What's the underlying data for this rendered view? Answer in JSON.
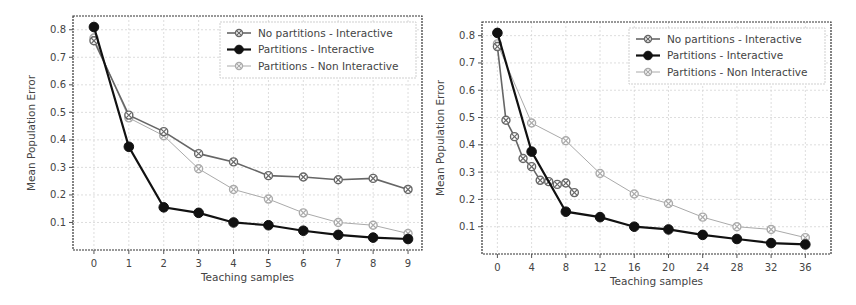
{
  "chart_data": [
    {
      "type": "line",
      "title": "",
      "xlabel": "Teaching samples",
      "ylabel": "Mean Population Error",
      "x": [
        0,
        1,
        2,
        3,
        4,
        5,
        6,
        7,
        8,
        9
      ],
      "xticks": [
        0,
        1,
        2,
        3,
        4,
        5,
        6,
        7,
        8,
        9
      ],
      "yticks": [
        0.1,
        0.2,
        0.3,
        0.4,
        0.5,
        0.6,
        0.7,
        0.8
      ],
      "xlim": [
        -0.6,
        9.4
      ],
      "ylim": [
        0.0,
        0.85
      ],
      "grid": true,
      "legend_position": "upper right",
      "series": [
        {
          "name": "No partitions - Interactive",
          "color": "#666666",
          "marker": "diamond-hatched",
          "x": [
            0,
            1,
            2,
            3,
            4,
            5,
            6,
            7,
            8,
            9
          ],
          "values": [
            0.76,
            0.49,
            0.43,
            0.35,
            0.32,
            0.27,
            0.265,
            0.255,
            0.26,
            0.22
          ]
        },
        {
          "name": "Partitions - Interactive",
          "color": "#111111",
          "marker": "circle",
          "x": [
            0,
            1,
            2,
            3,
            4,
            5,
            6,
            7,
            8,
            9
          ],
          "values": [
            0.81,
            0.375,
            0.155,
            0.135,
            0.1,
            0.09,
            0.07,
            0.055,
            0.045,
            0.04
          ]
        },
        {
          "name": "Partitions - Non Interactive",
          "color": "#aaaaaa",
          "marker": "diamond-hatched",
          "x": [
            0,
            1,
            2,
            3,
            4,
            5,
            6,
            7,
            8,
            9
          ],
          "values": [
            0.77,
            0.48,
            0.415,
            0.295,
            0.22,
            0.185,
            0.135,
            0.1,
            0.09,
            0.06
          ]
        }
      ]
    },
    {
      "type": "line",
      "title": "",
      "xlabel": "Teaching samples",
      "ylabel": "Mean Population Error",
      "xticks": [
        0,
        4,
        8,
        12,
        16,
        20,
        24,
        28,
        32,
        36
      ],
      "yticks": [
        0.1,
        0.2,
        0.3,
        0.4,
        0.5,
        0.6,
        0.7,
        0.8
      ],
      "xlim": [
        -1.8,
        39
      ],
      "ylim": [
        0.0,
        0.85
      ],
      "grid": true,
      "legend_position": "upper right",
      "series": [
        {
          "name": "No partitions - Interactive",
          "color": "#666666",
          "marker": "diamond-hatched",
          "x": [
            0,
            1,
            2,
            3,
            4,
            5,
            6,
            7,
            8,
            9
          ],
          "values": [
            0.76,
            0.49,
            0.43,
            0.35,
            0.32,
            0.27,
            0.265,
            0.255,
            0.26,
            0.225
          ]
        },
        {
          "name": "Partitions - Interactive",
          "color": "#111111",
          "marker": "circle",
          "x": [
            0,
            4,
            8,
            12,
            16,
            20,
            24,
            28,
            32,
            36
          ],
          "values": [
            0.81,
            0.375,
            0.155,
            0.135,
            0.1,
            0.09,
            0.07,
            0.055,
            0.04,
            0.035
          ]
        },
        {
          "name": "Partitions - Non Interactive",
          "color": "#aaaaaa",
          "marker": "diamond-hatched",
          "x": [
            0,
            4,
            8,
            12,
            16,
            20,
            24,
            28,
            32,
            36
          ],
          "values": [
            0.77,
            0.48,
            0.415,
            0.295,
            0.22,
            0.185,
            0.135,
            0.1,
            0.09,
            0.06
          ]
        }
      ]
    }
  ],
  "panels": [
    {
      "box": {
        "x": 73,
        "y": 16,
        "w": 349,
        "h": 234
      }
    },
    {
      "box": {
        "x": 482,
        "y": 22,
        "w": 349,
        "h": 232
      }
    }
  ]
}
